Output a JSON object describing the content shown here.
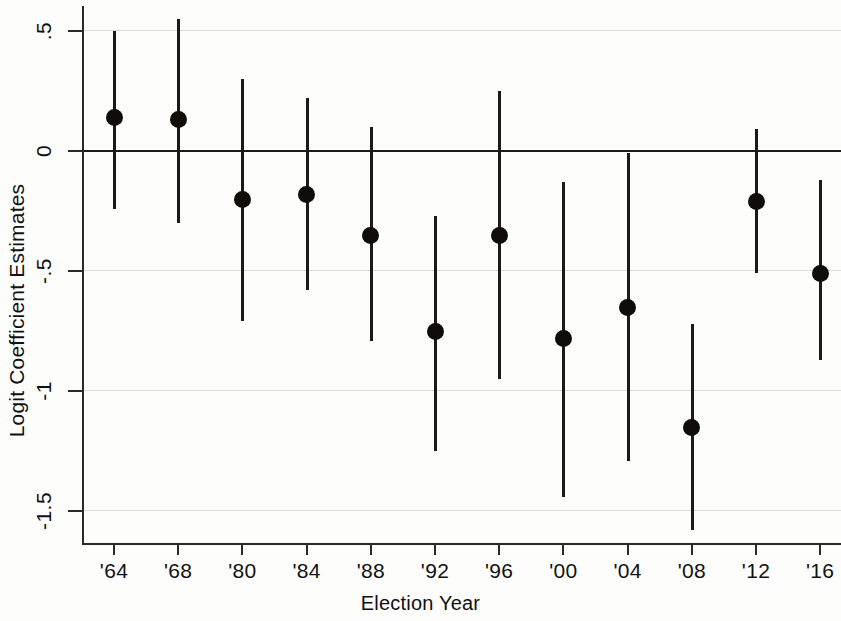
{
  "chart": {
    "title": "",
    "xlabel": "Election Year",
    "ylabel": "Logit Coefficient Estimates"
  },
  "yticks": [
    {
      "label": ".5",
      "value": 0.5
    },
    {
      "label": "0",
      "value": 0
    },
    {
      "label": "-.5",
      "value": -0.5
    },
    {
      "label": "-1",
      "value": -1
    },
    {
      "label": "-1.5",
      "value": -1.5
    }
  ],
  "chart_data": {
    "type": "scatter",
    "title": "",
    "xlabel": "Election Year",
    "ylabel": "Logit Coefficient Estimates",
    "ylim": [
      -1.68,
      0.62
    ],
    "ytick_values": [
      0.5,
      0,
      -0.5,
      -1,
      -1.5
    ],
    "ytick_labels": [
      ".5",
      "0",
      "-.5",
      "-1",
      "-1.5"
    ],
    "grid": "horizontal",
    "legend": "none",
    "zero_reference_line": 0,
    "categories": [
      "'64",
      "'68",
      "'80",
      "'84",
      "'88",
      "'92",
      "'96",
      "'00",
      "'04",
      "'08",
      "'12",
      "'16"
    ],
    "series": [
      {
        "name": "Logit coefficient estimate",
        "marker": "filled-circle",
        "error_bars": "95% confidence interval",
        "values": [
          0.14,
          0.13,
          -0.2,
          -0.18,
          -0.35,
          -0.75,
          -0.35,
          -0.78,
          -0.65,
          -1.15,
          -0.21,
          -0.51
        ],
        "ci_low": [
          -0.24,
          -0.3,
          -0.71,
          -0.58,
          -0.79,
          -1.25,
          -0.95,
          -1.44,
          -1.29,
          -1.58,
          -0.51,
          -0.87
        ],
        "ci_high": [
          0.5,
          0.55,
          0.3,
          0.22,
          0.1,
          -0.27,
          0.25,
          -0.13,
          -0.01,
          -0.72,
          0.09,
          -0.12
        ]
      }
    ],
    "points": [
      {
        "x": "'64",
        "estimate": 0.14,
        "ci_low": -0.24,
        "ci_high": 0.5
      },
      {
        "x": "'68",
        "estimate": 0.13,
        "ci_low": -0.3,
        "ci_high": 0.55
      },
      {
        "x": "'80",
        "estimate": -0.2,
        "ci_low": -0.71,
        "ci_high": 0.3
      },
      {
        "x": "'84",
        "estimate": -0.18,
        "ci_low": -0.58,
        "ci_high": 0.22
      },
      {
        "x": "'88",
        "estimate": -0.35,
        "ci_low": -0.79,
        "ci_high": 0.1
      },
      {
        "x": "'92",
        "estimate": -0.75,
        "ci_low": -1.25,
        "ci_high": -0.27
      },
      {
        "x": "'96",
        "estimate": -0.35,
        "ci_low": -0.95,
        "ci_high": 0.25
      },
      {
        "x": "'00",
        "estimate": -0.78,
        "ci_low": -1.44,
        "ci_high": -0.13
      },
      {
        "x": "'04",
        "estimate": -0.65,
        "ci_low": -1.29,
        "ci_high": -0.01
      },
      {
        "x": "'08",
        "estimate": -1.15,
        "ci_low": -1.58,
        "ci_high": -0.72
      },
      {
        "x": "'12",
        "estimate": -0.21,
        "ci_low": -0.51,
        "ci_high": 0.09
      },
      {
        "x": "'16",
        "estimate": -0.51,
        "ci_low": -0.87,
        "ci_high": -0.12
      }
    ]
  },
  "colors": {
    "marker": "#100c08",
    "axis": "#2a2a2a",
    "grid": "#dcdcd4",
    "background": "#fdfdfb"
  }
}
